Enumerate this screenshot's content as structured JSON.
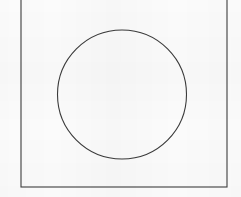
{
  "figure": {
    "background_color": "#fdfdfd",
    "canvas": {
      "width": 241,
      "height": 197
    },
    "stroke_color": "#3a3a3a",
    "fill_color": "none",
    "shapes": [
      {
        "name": "square",
        "type": "rect",
        "x": 21,
        "y": -18,
        "width": 206,
        "height": 205,
        "stroke_width": 1.1,
        "stroke_color": "#3f3f3f",
        "fill": "#fbfbfb",
        "note": "top edge extends above the visible canvas"
      },
      {
        "name": "circle",
        "type": "circle",
        "cx": 122,
        "cy": 94.5,
        "r": 64.5,
        "stroke_width": 1.1,
        "stroke_color": "#3a3a3a",
        "fill": "none"
      }
    ]
  }
}
